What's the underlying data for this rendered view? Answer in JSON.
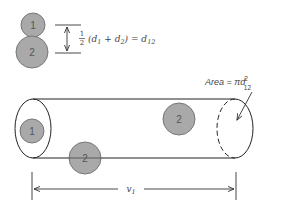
{
  "diagram": {
    "type": "collision-cylinder",
    "colors": {
      "stroke": "#222222",
      "particle_fill": "#a9a9a9",
      "particle_stroke": "#777777",
      "text": "#444444"
    },
    "top_pair": {
      "particle_1_label": "1",
      "particle_2_label": "2",
      "formula": {
        "fraction_num": "1",
        "fraction_den": "2",
        "expression": "(d1 + d2) = d12",
        "parts": [
          "(d",
          "1",
          " + d",
          "2",
          ") = d",
          "12"
        ]
      }
    },
    "cylinder": {
      "particle_inside_label": "1",
      "particle_bottom_label": "2",
      "particle_top_label": "2",
      "area_label": {
        "prefix": "Area = πd",
        "superscript": "2",
        "subscript": "12"
      }
    },
    "dimension": {
      "label": "v",
      "subscript": "1"
    }
  }
}
